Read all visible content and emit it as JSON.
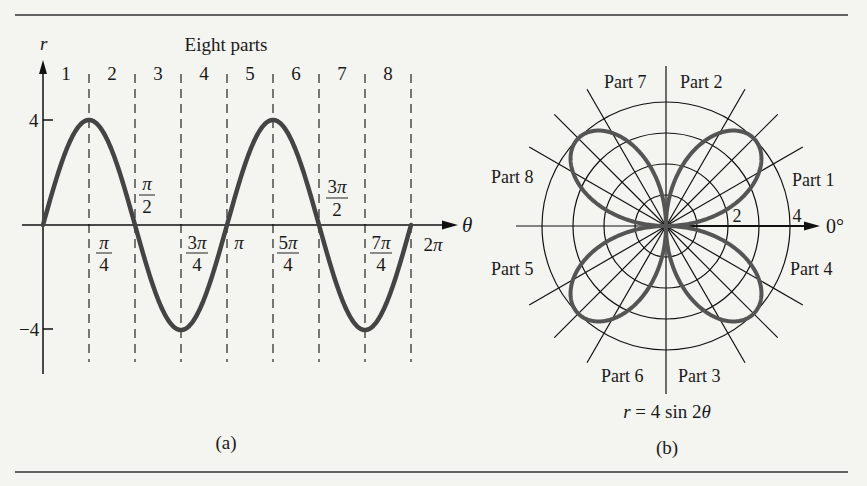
{
  "figure": {
    "left_caption": "(a)",
    "right_caption": "(b)",
    "equation": "r = 4 sin 2θ"
  },
  "chart_data": [
    {
      "type": "line",
      "title": "Eight parts",
      "xlabel": "θ",
      "ylabel": "r",
      "function": "r = 4 sin 2θ",
      "xlim": [
        0,
        6.2832
      ],
      "ylim": [
        -4,
        4
      ],
      "y_ticks": [
        "4",
        "−4"
      ],
      "x_tick_labels": [
        "π/4",
        "π/2",
        "3π/4",
        "π",
        "5π/4",
        "3π/2",
        "7π/4",
        "2π"
      ],
      "x_ticks_rad": [
        0.7854,
        1.5708,
        2.3562,
        3.1416,
        3.927,
        4.7124,
        5.4978,
        6.2832
      ],
      "parts": [
        "1",
        "2",
        "3",
        "4",
        "5",
        "6",
        "7",
        "8"
      ],
      "x": [
        0,
        0.3927,
        0.7854,
        1.1781,
        1.5708,
        1.9635,
        2.3562,
        2.7489,
        3.1416,
        3.5343,
        3.927,
        4.3197,
        4.7124,
        5.1051,
        5.4978,
        5.8905,
        6.2832
      ],
      "values": [
        0,
        2.83,
        4,
        2.83,
        0,
        -2.83,
        -4,
        -2.83,
        0,
        2.83,
        4,
        2.83,
        0,
        -2.83,
        -4,
        -2.83,
        0
      ],
      "dashed_gridlines": true
    },
    {
      "type": "polar",
      "title": "r = 4 sin 2θ",
      "function": "r = 4 sin 2θ",
      "radial_ticks": [
        "2",
        "4"
      ],
      "rings": [
        1,
        2,
        3,
        4
      ],
      "spokes_deg": [
        0,
        30,
        45,
        60,
        90,
        120,
        135,
        150,
        180,
        210,
        225,
        240,
        270,
        300,
        315,
        330
      ],
      "axis_label": "0°",
      "part_labels": [
        "Part 1",
        "Part 2",
        "Part 3",
        "Part 4",
        "Part 5",
        "Part 6",
        "Part 7",
        "Part 8"
      ],
      "petals": 4
    }
  ]
}
